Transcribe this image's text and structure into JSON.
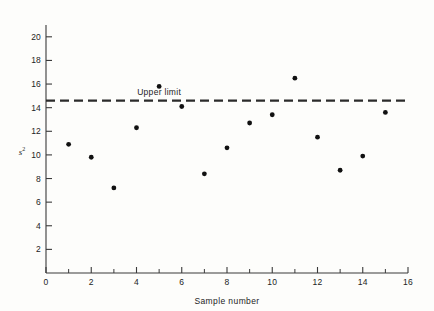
{
  "chart_data": {
    "type": "scatter",
    "title": "",
    "xlabel": "Sample  number",
    "ylabel": "s",
    "ylabel_superscript": "2",
    "xlim": [
      0,
      16
    ],
    "ylim": [
      0,
      21
    ],
    "grid": false,
    "legend": null,
    "x_ticks": [
      0,
      2,
      4,
      6,
      8,
      10,
      12,
      14,
      16
    ],
    "x_tick_labels": [
      "0",
      "2",
      "4",
      "6",
      "8",
      "10",
      "12",
      "14",
      "16"
    ],
    "x_minor_ticks": [
      1,
      3,
      5,
      7,
      9,
      11,
      13,
      15
    ],
    "y_ticks": [
      2,
      4,
      6,
      8,
      10,
      12,
      14,
      16,
      18,
      20
    ],
    "y_tick_labels": [
      "2",
      "4",
      "6",
      "8",
      "10",
      "12",
      "14",
      "16",
      "18",
      "20"
    ],
    "x": [
      1,
      2,
      3,
      4,
      5,
      6,
      7,
      8,
      9,
      10,
      11,
      12,
      13,
      14,
      15
    ],
    "values": [
      10.9,
      9.8,
      7.2,
      12.3,
      15.8,
      14.1,
      8.4,
      10.6,
      12.7,
      13.4,
      16.5,
      11.5,
      8.7,
      9.9,
      13.6
    ],
    "series": [
      {
        "name": "sample variance",
        "x": [
          1,
          2,
          3,
          4,
          5,
          6,
          7,
          8,
          9,
          10,
          11,
          12,
          13,
          14,
          15
        ],
        "values": [
          10.9,
          9.8,
          7.2,
          12.3,
          15.8,
          14.1,
          8.4,
          10.6,
          12.7,
          13.4,
          16.5,
          11.5,
          8.7,
          9.9,
          13.6
        ],
        "marker": "filled-circle",
        "color": "#111111"
      }
    ],
    "annotations": [
      {
        "type": "hline",
        "label": "Upper  limit",
        "y": 14.6,
        "style": "dashed",
        "color": "#2b2b2b"
      }
    ],
    "colors": {
      "marker": "#111111",
      "axis": "#3a3a3a",
      "limit_line": "#2b2b2b",
      "text": "#232323",
      "background": "#fdfdfb"
    }
  }
}
